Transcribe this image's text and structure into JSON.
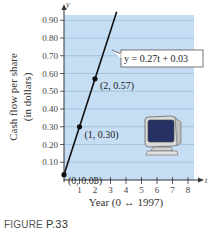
{
  "figure": {
    "caption_prefix": "FIGURE",
    "caption_number": "P.33"
  },
  "colors": {
    "plot_background": "#c6def4",
    "gridline": "#8fb0cc",
    "line": "#111111",
    "axis": "#333333",
    "label_box_border": "#555555"
  },
  "chart_data": {
    "type": "line",
    "title": "",
    "xlabel": "Year (0 ↔ 1997)",
    "ylabel": "Cash flow per share (in dollars)",
    "ylabel_line1": "Cash flow per share",
    "ylabel_line2": "(in dollars)",
    "x_axis_letter": "t",
    "y_axis_letter": "y",
    "xlim": [
      0,
      8
    ],
    "ylim": [
      0,
      0.95
    ],
    "x_ticks": [
      "1",
      "2",
      "3",
      "4",
      "5",
      "6",
      "7",
      "8"
    ],
    "y_ticks": [
      "0.10",
      "0.20",
      "0.30",
      "0.40",
      "0.50",
      "0.60",
      "0.70",
      "0.80",
      "0.90"
    ],
    "grid": true,
    "series": [
      {
        "name": "y = 0.27t + 0.03",
        "equation": "y = 0.27t + 0.03",
        "slope": 0.27,
        "intercept": 0.03,
        "x": [
          0,
          3.4
        ],
        "values": [
          0.03,
          0.948
        ]
      }
    ],
    "points": [
      {
        "t": 0,
        "y": 0.03,
        "label": "(0, 0.03)"
      },
      {
        "t": 1,
        "y": 0.3,
        "label": "(1, 0.30)"
      },
      {
        "t": 2,
        "y": 0.57,
        "label": "(2, 0.57)"
      }
    ],
    "annotations": [
      {
        "text": "y = 0.27t + 0.03",
        "type": "callout-box"
      },
      {
        "text": "computer-monitor-illustration",
        "type": "icon"
      }
    ]
  }
}
